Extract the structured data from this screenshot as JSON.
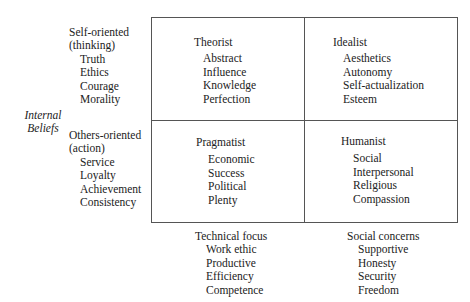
{
  "axis_left": {
    "label_line1": "Internal",
    "label_line2": "Beliefs"
  },
  "rows": [
    {
      "title_line1": "Self-oriented",
      "title_line2": "(thinking)",
      "items": [
        "Truth",
        "Ethics",
        "Courage",
        "Morality"
      ]
    },
    {
      "title_line1": "Others-oriented",
      "title_line2": "(action)",
      "items": [
        "Service",
        "Loyalty",
        "Achievement",
        "Consistency"
      ]
    }
  ],
  "quadrants": {
    "top_left": {
      "title": "Theorist",
      "items": [
        "Abstract",
        "Influence",
        "Knowledge",
        "Perfection"
      ]
    },
    "top_right": {
      "title": "Idealist",
      "items": [
        "Aesthetics",
        "Autonomy",
        "Self-actualization",
        "Esteem"
      ]
    },
    "bottom_left": {
      "title": "Pragmatist",
      "items": [
        "Economic",
        "Success",
        "Political",
        "Plenty"
      ]
    },
    "bottom_right": {
      "title": "Humanist",
      "items": [
        "Social",
        "Interpersonal",
        "Religious",
        "Compassion"
      ]
    }
  },
  "columns": [
    {
      "title": "Technical focus",
      "items": [
        "Work ethic",
        "Productive",
        "Efficiency",
        "Competence"
      ]
    },
    {
      "title": "Social concerns",
      "items": [
        "Supportive",
        "Honesty",
        "Security",
        "Freedom"
      ]
    }
  ]
}
